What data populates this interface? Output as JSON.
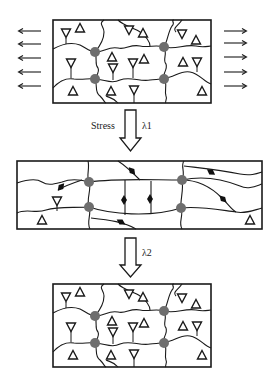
{
  "diagram": {
    "stage1": {
      "name": "initial-network",
      "pull_arrows": {
        "left": 5,
        "right": 5
      }
    },
    "arrow1": {
      "label": "Stress",
      "symbol": "λ1"
    },
    "stage2": {
      "name": "stretched-network"
    },
    "arrow2": {
      "symbol": "λ2"
    },
    "stage3": {
      "name": "recovered-network"
    },
    "colors": {
      "line": "#1a1a1a",
      "crosslink": "#6e6e6e",
      "diamond": "#111111",
      "background": "#ffffff"
    }
  }
}
